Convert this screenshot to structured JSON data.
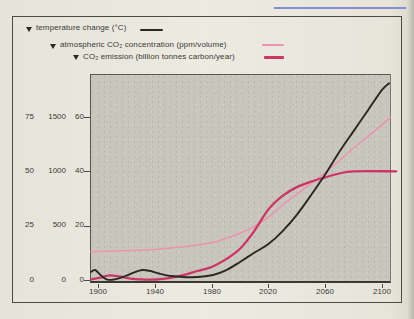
{
  "figure": {
    "legend_marker": "▼",
    "colors": {
      "plot_background": "#c9c6bd",
      "page_background": "#eae7df",
      "frame": "#4c4a42",
      "page_edge_line_blue": "#777cc9"
    }
  },
  "chart_data": {
    "type": "line",
    "title": "",
    "grid": false,
    "legend_position": "top-left",
    "x_axis": {
      "label": "year",
      "ticks": [
        1900,
        1940,
        1980,
        2020,
        2060,
        2100
      ],
      "range": [
        1895,
        2106
      ]
    },
    "y_axes": [
      {
        "name": "temperature change (°C)",
        "ticks": [
          75,
          50,
          25,
          0
        ]
      },
      {
        "name": "atmospheric CO₂ concentration (ppm/volume)",
        "ticks": [
          1500,
          1000,
          500,
          0
        ]
      },
      {
        "name": "CO₂ emission (billion tonnes carbon/year)",
        "ticks": [
          60,
          40,
          20,
          0
        ]
      }
    ],
    "series": [
      {
        "id": "temperature",
        "name": "temperature change (°C)",
        "axis": 0,
        "color": "#2a2822",
        "points": [
          [
            1895,
            3.7
          ],
          [
            1898,
            4.6
          ],
          [
            1902,
            2.2
          ],
          [
            1906,
            0.3
          ],
          [
            1910,
            0.1
          ],
          [
            1914,
            0.6
          ],
          [
            1920,
            2.0
          ],
          [
            1926,
            3.6
          ],
          [
            1931,
            4.6
          ],
          [
            1936,
            4.3
          ],
          [
            1943,
            3.0
          ],
          [
            1950,
            2.0
          ],
          [
            1958,
            1.5
          ],
          [
            1966,
            1.3
          ],
          [
            1974,
            1.6
          ],
          [
            1981,
            2.3
          ],
          [
            1990,
            4.4
          ],
          [
            2000,
            8.3
          ],
          [
            2010,
            12.5
          ],
          [
            2020,
            16.5
          ],
          [
            2030,
            22.5
          ],
          [
            2040,
            30.0
          ],
          [
            2050,
            39.0
          ],
          [
            2060,
            48.5
          ],
          [
            2070,
            59.0
          ],
          [
            2080,
            68.5
          ],
          [
            2090,
            78.0
          ],
          [
            2100,
            87.5
          ],
          [
            2105,
            90.5
          ]
        ]
      },
      {
        "id": "co2_concentration",
        "name": "atmospheric CO₂ concentration (ppm/volume)",
        "axis": 1,
        "color": "#ec93b0",
        "points": [
          [
            1895,
            260
          ],
          [
            1910,
            266
          ],
          [
            1925,
            272
          ],
          [
            1940,
            281
          ],
          [
            1955,
            298
          ],
          [
            1970,
            323
          ],
          [
            1980,
            342
          ],
          [
            1990,
            382
          ],
          [
            2000,
            430
          ],
          [
            2010,
            492
          ],
          [
            2020,
            578
          ],
          [
            2030,
            690
          ],
          [
            2040,
            790
          ],
          [
            2050,
            890
          ],
          [
            2060,
            990
          ],
          [
            2070,
            1100
          ],
          [
            2080,
            1215
          ],
          [
            2090,
            1320
          ],
          [
            2100,
            1430
          ],
          [
            2106,
            1497
          ]
        ]
      },
      {
        "id": "co2_emission",
        "name": "CO₂ emission (billion tonnes carbon/year)",
        "axis": 2,
        "color": "#cc3566",
        "points": [
          [
            1895,
            0.2
          ],
          [
            1902,
            0.9
          ],
          [
            1908,
            1.7
          ],
          [
            1915,
            1.3
          ],
          [
            1923,
            0.5
          ],
          [
            1932,
            0.2
          ],
          [
            1941,
            0.2
          ],
          [
            1950,
            0.7
          ],
          [
            1960,
            1.8
          ],
          [
            1970,
            3.3
          ],
          [
            1980,
            4.8
          ],
          [
            1990,
            7.6
          ],
          [
            2000,
            11.5
          ],
          [
            2010,
            18.0
          ],
          [
            2020,
            26.0
          ],
          [
            2030,
            31.0
          ],
          [
            2040,
            34.2
          ],
          [
            2050,
            36.2
          ],
          [
            2060,
            37.8
          ],
          [
            2070,
            39.2
          ],
          [
            2080,
            40.0
          ],
          [
            2110,
            40.0
          ]
        ]
      }
    ]
  }
}
